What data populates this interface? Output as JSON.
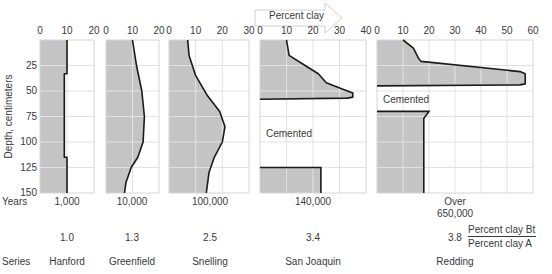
{
  "chart_data": {
    "type": "area",
    "title": "",
    "arrow_label": "Percent clay",
    "xlabel": "Percent clay",
    "ylabel": "Depth, centimeters",
    "y_ticks": [
      25,
      50,
      75,
      100,
      125,
      150
    ],
    "y_top_tick": 0,
    "ylim": [
      0,
      150
    ],
    "grid": true,
    "fill_color": "#c4c4c4",
    "line_color": "#1a1a1a",
    "row_labels": {
      "years": "Years",
      "series": "Series"
    },
    "ratio_label": {
      "numerator": "Percent clay Bt",
      "denominator": "Percent clay A"
    },
    "panels": [
      {
        "series": "Hanford",
        "years": "1,000",
        "ratio": "1.0",
        "xlim": [
          0,
          20
        ],
        "x_ticks": [
          0,
          10,
          20
        ],
        "profile": [
          [
            0,
            10
          ],
          [
            33,
            10
          ],
          [
            33,
            9
          ],
          [
            115,
            9
          ],
          [
            115,
            10
          ],
          [
            150,
            10
          ]
        ]
      },
      {
        "series": "Greenfield",
        "years": "10,000",
        "ratio": "1.3",
        "xlim": [
          0,
          20
        ],
        "x_ticks": [
          0,
          10,
          20
        ],
        "profile": [
          [
            0,
            10
          ],
          [
            25,
            11.5
          ],
          [
            50,
            13.5
          ],
          [
            75,
            14.5
          ],
          [
            100,
            14
          ],
          [
            115,
            12
          ],
          [
            125,
            9.5
          ],
          [
            140,
            7.5
          ],
          [
            150,
            7
          ]
        ]
      },
      {
        "series": "Snelling",
        "years": "100,000",
        "ratio": "2.5",
        "xlim": [
          0,
          30
        ],
        "x_ticks": [
          0,
          10,
          20,
          30
        ],
        "profile": [
          [
            0,
            7
          ],
          [
            15,
            7.5
          ],
          [
            35,
            10
          ],
          [
            55,
            14.5
          ],
          [
            70,
            19
          ],
          [
            85,
            21
          ],
          [
            100,
            20
          ],
          [
            115,
            17
          ],
          [
            130,
            15
          ],
          [
            150,
            14
          ]
        ]
      },
      {
        "series": "San Joaquin",
        "years": "140,000",
        "ratio": "3.4",
        "xlim": [
          0,
          40
        ],
        "x_ticks": [
          0,
          10,
          20,
          30,
          40
        ],
        "profile": [
          [
            0,
            10
          ],
          [
            15,
            11
          ],
          [
            25,
            17
          ],
          [
            33,
            22
          ],
          [
            42,
            25
          ],
          [
            49,
            32
          ],
          [
            52,
            35
          ],
          [
            56,
            35
          ],
          [
            57,
            33
          ],
          [
            58,
            0
          ]
        ],
        "cemented": {
          "from": 58,
          "to": 125,
          "label": "Cemented"
        },
        "lower": [
          [
            125,
            0
          ],
          [
            125,
            23
          ],
          [
            150,
            23
          ]
        ]
      },
      {
        "series": "Redding",
        "years": "Over\n650,000",
        "ratio": "3.8",
        "xlim": [
          0,
          60
        ],
        "x_ticks": [
          0,
          10,
          20,
          30,
          40,
          50,
          60
        ],
        "profile": [
          [
            0,
            10
          ],
          [
            8,
            14
          ],
          [
            18,
            16
          ],
          [
            21,
            17
          ],
          [
            31,
            55
          ],
          [
            33,
            57
          ],
          [
            43,
            57
          ],
          [
            44,
            55
          ],
          [
            45,
            0
          ]
        ],
        "cemented": {
          "from": 45,
          "to": 70,
          "label": "Cemented"
        },
        "lower": [
          [
            70,
            0
          ],
          [
            70,
            20
          ],
          [
            77,
            18
          ],
          [
            150,
            18
          ]
        ]
      }
    ]
  }
}
